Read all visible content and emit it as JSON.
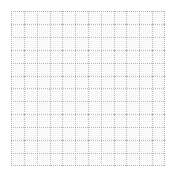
{
  "page": {
    "title": "Grid Pattern",
    "width": 176,
    "height": 179,
    "background_color": "#ffffff"
  },
  "grid": {
    "name": "dotted-graph-grid",
    "origin_x": 11,
    "origin_y": 11,
    "width": 154,
    "height": 155,
    "columns": 12,
    "rows": 12,
    "cell_width": 12.83,
    "cell_height": 12.92,
    "line_color": "#b9b9bd",
    "edge_line_color": "#b0b0b4",
    "node_color": "#a8a8ad",
    "line_style": "dotted",
    "line_width": 1,
    "dash_pattern": "1 1",
    "micro_grid": {
      "visible": true,
      "spacing": 2,
      "color": "#bebec3",
      "opacity": 0.3
    },
    "surface_color": "#ffffff"
  },
  "chart_data": {
    "type": "table",
    "title": "",
    "xlabel": "",
    "ylabel": "",
    "categories": [],
    "values": [],
    "grid": true,
    "legend": "none"
  }
}
